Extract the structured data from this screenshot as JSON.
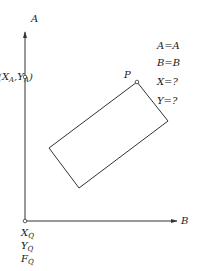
{
  "axes": {
    "vertical_label": "A",
    "horizontal_label": "B"
  },
  "point_a": {
    "label_x": "X",
    "label_y": "Y",
    "subscript": "A"
  },
  "point_p": {
    "label": "P"
  },
  "origin_labels": [
    {
      "main": "X",
      "sub": "Q"
    },
    {
      "main": "Y",
      "sub": "Q"
    },
    {
      "main": "F",
      "sub": "Q"
    }
  ],
  "equations": [
    "A=A",
    "B=B",
    "X=?",
    "Y=?"
  ],
  "colors": {
    "stroke": "#333333",
    "text": "#222222"
  }
}
